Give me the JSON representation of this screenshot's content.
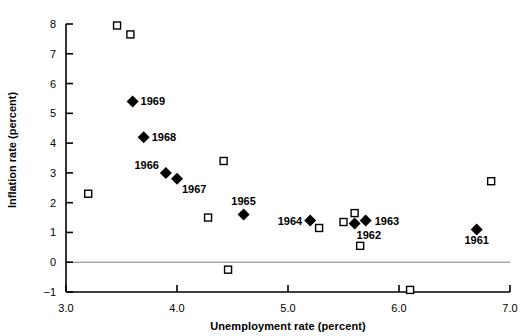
{
  "chart_data": {
    "type": "scatter",
    "title": "",
    "xlabel": "Unemployment rate (percent)",
    "ylabel": "Inflation rate (percent)",
    "xlim": [
      3.0,
      7.0
    ],
    "ylim": [
      -1,
      8
    ],
    "xticks": [
      "3.0",
      "4.0",
      "5.0",
      "6.0",
      "7.0"
    ],
    "xtick_values": [
      3.0,
      4.0,
      5.0,
      6.0,
      7.0
    ],
    "yticks": [
      "8",
      "7",
      "6",
      "5",
      "4",
      "3",
      "2",
      "1",
      "0",
      "-1"
    ],
    "ytick_values": [
      8,
      7,
      6,
      5,
      4,
      3,
      2,
      1,
      0,
      -1
    ],
    "grid": false,
    "legend": null,
    "zero_line": true,
    "series": [
      {
        "name": "Labeled years (1961-1969)",
        "marker": "filled-diamond",
        "color": "#000000",
        "points": [
          {
            "label": "1961",
            "x": 6.7,
            "y": 1.1,
            "label_dx": 0,
            "label_dy": 15,
            "label_anchor": "middle"
          },
          {
            "label": "1962",
            "x": 5.6,
            "y": 1.3,
            "label_dx": 2,
            "label_dy": 15,
            "label_anchor": "start"
          },
          {
            "label": "1963",
            "x": 5.7,
            "y": 1.4,
            "label_dx": 9,
            "label_dy": 4,
            "label_anchor": "start"
          },
          {
            "label": "1964",
            "x": 5.2,
            "y": 1.4,
            "label_dx": -8,
            "label_dy": 4,
            "label_anchor": "end"
          },
          {
            "label": "1965",
            "x": 4.6,
            "y": 1.6,
            "label_dx": 0,
            "label_dy": -10,
            "label_anchor": "middle"
          },
          {
            "label": "1966",
            "x": 3.9,
            "y": 3.0,
            "label_dx": -7,
            "label_dy": -4,
            "label_anchor": "end"
          },
          {
            "label": "1967",
            "x": 4.0,
            "y": 2.8,
            "label_dx": 5,
            "label_dy": 14,
            "label_anchor": "start"
          },
          {
            "label": "1968",
            "x": 3.7,
            "y": 4.2,
            "label_dx": 8,
            "label_dy": 4,
            "label_anchor": "start"
          },
          {
            "label": "1969",
            "x": 3.6,
            "y": 5.4,
            "label_dx": 8,
            "label_dy": 4,
            "label_anchor": "start"
          }
        ]
      },
      {
        "name": "Other years (unlabeled)",
        "marker": "open-square",
        "color": "#000000",
        "points": [
          {
            "x": 3.46,
            "y": 7.95
          },
          {
            "x": 3.58,
            "y": 7.65
          },
          {
            "x": 3.2,
            "y": 2.3
          },
          {
            "x": 4.42,
            "y": 3.4
          },
          {
            "x": 4.28,
            "y": 1.5
          },
          {
            "x": 4.46,
            "y": -0.25
          },
          {
            "x": 5.28,
            "y": 1.15
          },
          {
            "x": 5.6,
            "y": 1.65
          },
          {
            "x": 5.5,
            "y": 1.35
          },
          {
            "x": 5.65,
            "y": 0.55
          },
          {
            "x": 6.1,
            "y": -0.93
          },
          {
            "x": 6.83,
            "y": 2.72
          }
        ]
      }
    ]
  },
  "axes": {
    "xlabel": "Unemployment rate (percent)",
    "ylabel": "Inflation rate (percent)"
  },
  "colors": {
    "axis": "#000000",
    "marker": "#000000",
    "zero_line": "#808080",
    "background": "#ffffff"
  }
}
